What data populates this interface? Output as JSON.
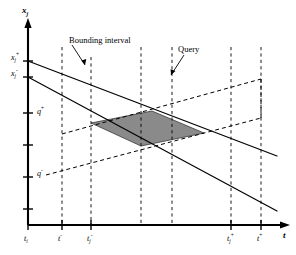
{
  "figure": {
    "kind": "2d-line-diagram",
    "background_color": "#ffffff",
    "ink_color": "#000000",
    "shade_color": "#808080",
    "axes": {
      "y_axis_label": "x",
      "y_axis_label_sub": "j",
      "x_axis_label": "t"
    },
    "y_ticks": [
      {
        "label_base": "x",
        "label_sup": "+",
        "label_sub": "j",
        "show_text": true
      },
      {
        "label_base": "x",
        "label_sup": "-",
        "label_sub": "j",
        "show_text": true
      },
      {
        "label_base": "",
        "label_sup": "",
        "label_sub": "",
        "show_text": false
      },
      {
        "label_base": "",
        "label_sup": "",
        "label_sub": "",
        "show_text": false
      },
      {
        "label_base": "",
        "label_sup": "",
        "label_sub": "",
        "show_text": false
      },
      {
        "label_base": "",
        "label_sup": "",
        "label_sub": "",
        "show_text": false
      }
    ],
    "q_labels": [
      {
        "base": "q",
        "sup": "+"
      },
      {
        "base": "q",
        "sup": "-"
      }
    ],
    "x_ticks": [
      {
        "base": "t",
        "sub": "i",
        "sup": ""
      },
      {
        "base": "t",
        "sub": "",
        "sup": "-"
      },
      {
        "base": "t",
        "sub": "j",
        "sup": "-"
      },
      {
        "base": "t",
        "sub": "j",
        "sup": "+"
      },
      {
        "base": "t",
        "sub": "",
        "sup": "+"
      }
    ],
    "annotations": [
      {
        "name": "bounding-interval",
        "text": "Bounding interval"
      },
      {
        "name": "query",
        "text": "Query"
      }
    ]
  }
}
